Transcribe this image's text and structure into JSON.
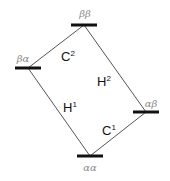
{
  "diagram": {
    "type": "energy-level-diagram",
    "colors": {
      "level_bar": "#111111",
      "transition_line": "#555555",
      "state_label": "#8a8a8a",
      "transition_label": "#111111",
      "background": "#ffffff"
    },
    "levels": [
      {
        "id": "bb",
        "label": "ββ",
        "x": 84,
        "y": 25,
        "half_width": 13
      },
      {
        "id": "ba",
        "label": "βα",
        "x": 28,
        "y": 68,
        "half_width": 13
      },
      {
        "id": "ab",
        "label": "αβ",
        "x": 146,
        "y": 112,
        "half_width": 13
      },
      {
        "id": "aa",
        "label": "αα",
        "x": 90,
        "y": 156,
        "half_width": 13
      }
    ],
    "transitions": [
      {
        "id": "C2",
        "base": "C",
        "sup": "2",
        "from": "ba",
        "to": "bb"
      },
      {
        "id": "H2",
        "base": "H",
        "sup": "2",
        "from": "ab",
        "to": "bb"
      },
      {
        "id": "H1",
        "base": "H",
        "sup": "1",
        "from": "aa",
        "to": "ba"
      },
      {
        "id": "C1",
        "base": "C",
        "sup": "1",
        "from": "aa",
        "to": "ab"
      }
    ]
  }
}
